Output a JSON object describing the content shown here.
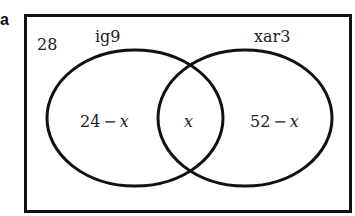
{
  "part_label": "a",
  "diagram": {
    "type": "venn",
    "outside_value": "28",
    "sets": [
      {
        "name": "ig9",
        "only_region": "24 − x",
        "only_num": "24",
        "only_var": "x"
      },
      {
        "name": "xar3",
        "only_region": "52 − x",
        "only_num": "52",
        "only_var": "x"
      }
    ],
    "intersection": "x",
    "minus_sign": "−"
  }
}
